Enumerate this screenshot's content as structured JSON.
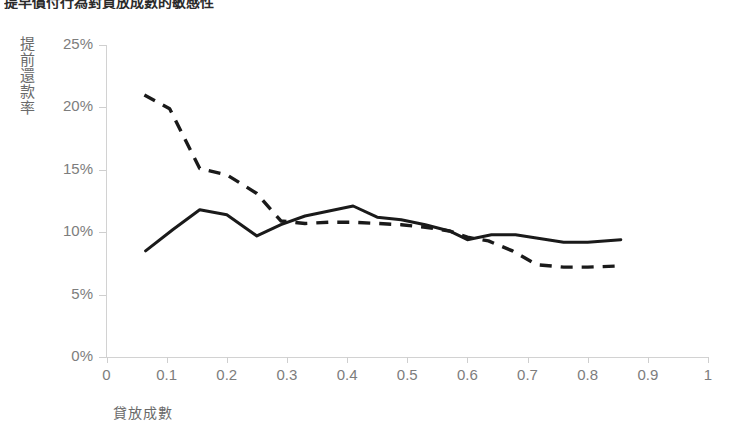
{
  "title": "提早償付行為對貸放成數的敏感性",
  "y_axis_title": "提前還款率",
  "x_axis_title": "貸放成數",
  "y_tick_labels": [
    "25%",
    "20%",
    "15%",
    "10%",
    "5%",
    "0%"
  ],
  "x_tick_labels": [
    "0",
    "0.1",
    "0.2",
    "0.3",
    "0.4",
    "0.5",
    "0.6",
    "0.7",
    "0.8",
    "0.9",
    "1"
  ],
  "colors": {
    "series_line": "#1a1a1a",
    "axis": "#d2d2d2",
    "tick_text": "#7d7d7d",
    "axis_title_text": "#6a6a6a",
    "background": "#ffffff"
  },
  "chart_data": {
    "type": "line",
    "title": "提早償付行為對貸放成數的敏感性",
    "xlabel": "貸放成數",
    "ylabel": "提前還款率",
    "xlim": [
      0,
      1
    ],
    "ylim": [
      0,
      25
    ],
    "y_unit": "percent",
    "grid": false,
    "legend": "none",
    "x_ticks": [
      0,
      0.1,
      0.2,
      0.3,
      0.4,
      0.5,
      0.6,
      0.7,
      0.8,
      0.9,
      1
    ],
    "y_ticks": [
      0,
      5,
      10,
      15,
      20,
      25
    ],
    "series": [
      {
        "name": "solid-series",
        "style": "solid",
        "x": [
          0.065,
          0.11,
          0.155,
          0.2,
          0.25,
          0.29,
          0.33,
          0.37,
          0.41,
          0.45,
          0.49,
          0.53,
          0.57,
          0.6,
          0.64,
          0.68,
          0.72,
          0.76,
          0.8,
          0.855
        ],
        "values": [
          8.5,
          10.2,
          11.8,
          11.4,
          9.7,
          10.6,
          11.3,
          11.7,
          12.1,
          11.2,
          11.0,
          10.6,
          10.1,
          9.4,
          9.8,
          9.8,
          9.5,
          9.2,
          9.2,
          9.4
        ]
      },
      {
        "name": "dashed-series",
        "style": "dashed",
        "x": [
          0.063,
          0.105,
          0.155,
          0.2,
          0.25,
          0.29,
          0.33,
          0.37,
          0.41,
          0.45,
          0.49,
          0.53,
          0.57,
          0.6,
          0.635,
          0.675,
          0.715,
          0.76,
          0.8,
          0.855
        ],
        "values": [
          21.0,
          19.9,
          15.1,
          14.6,
          13.1,
          10.9,
          10.7,
          10.8,
          10.8,
          10.7,
          10.6,
          10.4,
          10.1,
          9.6,
          9.3,
          8.5,
          7.4,
          7.2,
          7.2,
          7.3
        ]
      }
    ]
  }
}
